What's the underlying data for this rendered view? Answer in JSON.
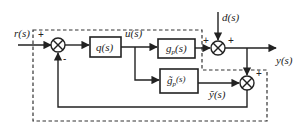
{
  "diagram": {
    "type": "block-diagram",
    "signals": {
      "reference": "r(s)",
      "control": "u(s)",
      "disturbance": "d(s)",
      "output": "y(s)",
      "model_output": "ỹ(s)"
    },
    "blocks": {
      "controller": {
        "label": "q(s)"
      },
      "plant": {
        "label_main": "g",
        "label_sub": "p",
        "label_arg": "(s)"
      },
      "model": {
        "label_main": "g̃",
        "label_sub": "p",
        "label_arg": "(s)"
      }
    },
    "summing_junctions": {
      "input": {
        "signs": [
          "+",
          "-"
        ]
      },
      "disturbance": {
        "signs": [
          "+",
          "+"
        ]
      },
      "feedback": {
        "signs": [
          "-",
          "+"
        ]
      }
    }
  }
}
